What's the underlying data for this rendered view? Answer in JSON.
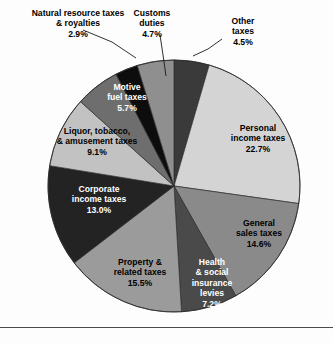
{
  "figure": {
    "width": 333,
    "height": 343,
    "background": "#fdfdfd",
    "rule_y": 327,
    "rule_color": "#4a4a4a"
  },
  "chart_data": {
    "type": "pie",
    "title": "",
    "subtitle": "",
    "xlabel": "",
    "ylabel": "",
    "legend_position": "none",
    "grid": false,
    "center": [
      174,
      186
    ],
    "radius": 126,
    "start_angle_deg": -90,
    "direction": "clockwise",
    "units": "percent",
    "total": 100.0,
    "categories": [
      "Other taxes",
      "Personal income taxes",
      "General sales taxes",
      "Health & social insurance levies",
      "Property & related taxes",
      "Corporate income taxes",
      "Liquor, tobacco, & amusement taxes",
      "Motive fuel taxes",
      "Natural resource taxes & royalties",
      "Customs duties"
    ],
    "values": [
      4.5,
      22.7,
      14.6,
      7.2,
      15.5,
      13.0,
      9.1,
      5.7,
      2.9,
      4.7
    ],
    "colors": [
      "#3a3a3a",
      "#d4d4d4",
      "#8a8a8a",
      "#4a4a4a",
      "#9b9b9b",
      "#232323",
      "#c2c2c2",
      "#6e6e6e",
      "#0d0d0d",
      "#8f8f8f"
    ],
    "slices": [
      {
        "name": "other-taxes",
        "label_lines": [
          "Other",
          "taxes",
          "4.5%"
        ],
        "value": 4.5,
        "percent_text": "4.5%",
        "color": "#3a3a3a",
        "label_placement": "outside",
        "text_color": "#000000",
        "label_x": 243,
        "label_y": 24,
        "leader": [
          [
            222,
            39
          ],
          [
            208,
            49
          ],
          [
            193,
            56
          ]
        ]
      },
      {
        "name": "personal-income-taxes",
        "label_lines": [
          "Personal",
          "income taxes",
          "22.7%"
        ],
        "value": 22.7,
        "percent_text": "22.7%",
        "color": "#d4d4d4",
        "label_placement": "inside",
        "text_color": "#000000",
        "label_x": 258,
        "label_y": 131
      },
      {
        "name": "general-sales-taxes",
        "label_lines": [
          "General",
          "sales taxes",
          "14.6%"
        ],
        "value": 14.6,
        "percent_text": "14.6%",
        "color": "#8a8a8a",
        "label_placement": "inside",
        "text_color": "#000000",
        "label_x": 259,
        "label_y": 226
      },
      {
        "name": "health-social-insurance-levies",
        "label_lines": [
          "Health",
          "& social",
          "insurance",
          "levies",
          "7.2%"
        ],
        "value": 7.2,
        "percent_text": "7.2%",
        "color": "#4a4a4a",
        "label_placement": "inside",
        "text_color": "#ffffff",
        "label_x": 212,
        "label_y": 265
      },
      {
        "name": "property-related-taxes",
        "label_lines": [
          "Property &",
          "related taxes",
          "15.5%"
        ],
        "value": 15.5,
        "percent_text": "15.5%",
        "color": "#9b9b9b",
        "label_placement": "inside",
        "text_color": "#000000",
        "label_x": 140,
        "label_y": 265
      },
      {
        "name": "corporate-income-taxes",
        "label_lines": [
          "Corporate",
          "income taxes",
          "13.0%"
        ],
        "value": 13.0,
        "percent_text": "13.0%",
        "color": "#232323",
        "label_placement": "inside",
        "text_color": "#ffffff",
        "label_x": 99,
        "label_y": 192
      },
      {
        "name": "liquor-tobacco-amusement-taxes",
        "label_lines": [
          "Liquor, tobacco,",
          "& amusement taxes",
          "9.1%"
        ],
        "value": 9.1,
        "percent_text": "9.1%",
        "color": "#c2c2c2",
        "label_placement": "inside",
        "text_color": "#000000",
        "label_x": 97,
        "label_y": 134
      },
      {
        "name": "motive-fuel-taxes",
        "label_lines": [
          "Motive",
          "fuel taxes",
          "5.7%"
        ],
        "value": 5.7,
        "percent_text": "5.7%",
        "color": "#6e6e6e",
        "label_placement": "inside",
        "text_color": "#ffffff",
        "label_x": 127,
        "label_y": 90
      },
      {
        "name": "natural-resource-taxes-royalties",
        "label_lines": [
          "Natural resource taxes",
          "& royalties",
          "2.9%"
        ],
        "value": 2.9,
        "percent_text": "2.9%",
        "color": "#0d0d0d",
        "label_placement": "outside",
        "text_color": "#000000",
        "label_x": 78,
        "label_y": 16,
        "label_anchor": "end",
        "leader": [
          [
            83,
            30
          ],
          [
            112,
            42
          ],
          [
            136,
            58
          ]
        ]
      },
      {
        "name": "customs-duties",
        "label_lines": [
          "Customs",
          "duties",
          "4.7%"
        ],
        "value": 4.7,
        "percent_text": "4.7%",
        "color": "#8f8f8f",
        "label_placement": "outside",
        "text_color": "#000000",
        "label_x": 152,
        "label_y": 16,
        "leader": [
          [
            160,
            35
          ],
          [
            163,
            55
          ],
          [
            166,
            76
          ]
        ]
      }
    ]
  }
}
